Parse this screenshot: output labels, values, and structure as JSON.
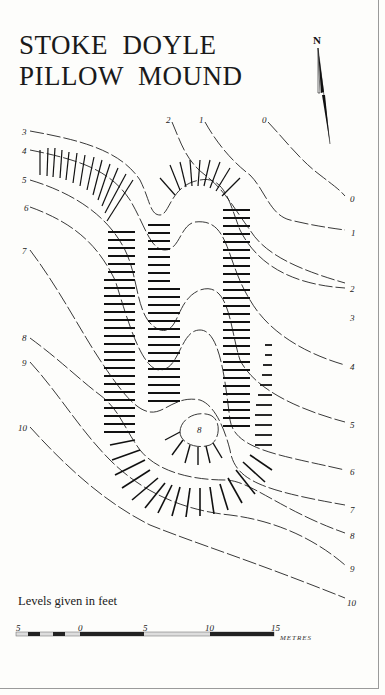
{
  "title": {
    "line1": "STOKE  DOYLE",
    "line2": "PILLOW  MOUND"
  },
  "north_arrow": {
    "label": "N",
    "icon": "north-arrow-icon"
  },
  "contours_left": [
    {
      "label": "3",
      "x": 22,
      "y": 127
    },
    {
      "label": "4",
      "x": 22,
      "y": 146
    },
    {
      "label": "5",
      "x": 22,
      "y": 175
    },
    {
      "label": "6",
      "x": 24,
      "y": 203
    },
    {
      "label": "7",
      "x": 22,
      "y": 246
    },
    {
      "label": "8",
      "x": 22,
      "y": 333
    },
    {
      "label": "9",
      "x": 22,
      "y": 358
    },
    {
      "label": "10",
      "x": 18,
      "y": 423
    }
  ],
  "contours_top": [
    {
      "label": "2",
      "x": 166,
      "y": 115
    },
    {
      "label": "1",
      "x": 199,
      "y": 115
    },
    {
      "label": "0",
      "x": 262,
      "y": 115
    }
  ],
  "contours_right": [
    {
      "label": "0",
      "x": 350,
      "y": 194
    },
    {
      "label": "1",
      "x": 351,
      "y": 228
    },
    {
      "label": "2",
      "x": 350,
      "y": 284
    },
    {
      "label": "3",
      "x": 350,
      "y": 313
    },
    {
      "label": "4",
      "x": 350,
      "y": 362
    },
    {
      "label": "5",
      "x": 350,
      "y": 420
    },
    {
      "label": "6",
      "x": 350,
      "y": 467
    },
    {
      "label": "7",
      "x": 350,
      "y": 505
    },
    {
      "label": "8",
      "x": 350,
      "y": 531
    },
    {
      "label": "9",
      "x": 350,
      "y": 564
    },
    {
      "label": "10",
      "x": 347,
      "y": 598
    }
  ],
  "spot_height": {
    "label": "8",
    "x": 197,
    "y": 425
  },
  "legend": {
    "text": "Levels given in feet"
  },
  "scale_bar": {
    "ticks": [
      {
        "label": "5",
        "x": 16
      },
      {
        "label": "0",
        "x": 78
      },
      {
        "label": "5",
        "x": 143
      },
      {
        "label": "10",
        "x": 205
      },
      {
        "label": "15",
        "x": 271
      }
    ],
    "unit": "METRES"
  }
}
